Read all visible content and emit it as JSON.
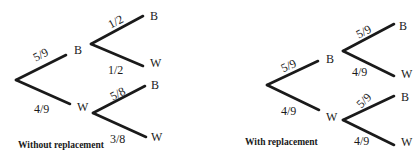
{
  "diagrams": [
    {
      "caption": "Without replacement",
      "root": {
        "x": 16,
        "y": 80
      },
      "level1": [
        {
          "outcome": "B",
          "prob": "5/9",
          "end": [
            66,
            55
          ],
          "label_pos": [
            74,
            54
          ],
          "prob_pos": [
            33,
            59
          ],
          "prob_rot": -28
        },
        {
          "outcome": "W",
          "prob": "4/9",
          "end": [
            70,
            104
          ],
          "label_pos": [
            77,
            111
          ],
          "prob_pos": [
            34,
            113
          ],
          "prob_rot": 0
        }
      ],
      "level2": [
        {
          "parent": "B",
          "start": [
            91,
            44
          ],
          "branches": [
            {
              "outcome": "B",
              "prob": "1/2",
              "end": [
                143,
                16
              ],
              "label_pos": [
                150,
                20
              ],
              "prob_pos": [
                108,
                26
              ],
              "prob_rot": -28
            },
            {
              "outcome": "W",
              "prob": "1/2",
              "end": [
                143,
                66
              ],
              "label_pos": [
                150,
                67
              ],
              "prob_pos": [
                108,
                74
              ],
              "prob_rot": 0
            }
          ]
        },
        {
          "parent": "W",
          "start": [
            93,
            113
          ],
          "branches": [
            {
              "outcome": "B",
              "prob": "5/8",
              "end": [
                145,
                86
              ],
              "label_pos": [
                151,
                89
              ],
              "prob_pos": [
                110,
                98
              ],
              "prob_rot": -28
            },
            {
              "outcome": "W",
              "prob": "3/8",
              "end": [
                146,
                137
              ],
              "label_pos": [
                151,
                141
              ],
              "prob_pos": [
                110,
                143
              ],
              "prob_rot": 0
            }
          ]
        }
      ],
      "caption_pos": [
        18,
        148
      ]
    },
    {
      "caption": "With replacement",
      "root": {
        "x": 267,
        "y": 85
      },
      "level1": [
        {
          "outcome": "B",
          "prob": "5/9",
          "end": [
            318,
            61
          ],
          "label_pos": [
            326,
            63
          ],
          "prob_pos": [
            281,
            70
          ],
          "prob_rot": -25
        },
        {
          "outcome": "W",
          "prob": "4/9",
          "end": [
            319,
            110
          ],
          "label_pos": [
            326,
            121
          ],
          "prob_pos": [
            281,
            115
          ],
          "prob_rot": 0
        }
      ],
      "level2": [
        {
          "parent": "B",
          "start": [
            343,
            51
          ],
          "branches": [
            {
              "outcome": "B",
              "prob": "5/9",
              "end": [
                394,
                24
              ],
              "label_pos": [
                399,
                30
              ],
              "prob_pos": [
                356,
                36
              ],
              "prob_rot": -28
            },
            {
              "outcome": "W",
              "prob": "4/9",
              "end": [
                394,
                76
              ],
              "label_pos": [
                401,
                78
              ],
              "prob_pos": [
                352,
                76
              ],
              "prob_rot": 0
            }
          ]
        },
        {
          "parent": "W",
          "start": [
            343,
            120
          ],
          "branches": [
            {
              "outcome": "B",
              "prob": "5/9",
              "end": [
                394,
                96
              ],
              "label_pos": [
                401,
                101
              ],
              "prob_pos": [
                356,
                106
              ],
              "prob_rot": -45
            },
            {
              "outcome": "W",
              "prob": "4/9",
              "end": [
                394,
                145
              ],
              "label_pos": [
                401,
                146
              ],
              "prob_pos": [
                354,
                145
              ],
              "prob_rot": 0
            }
          ]
        }
      ],
      "caption_pos": [
        245,
        145
      ]
    }
  ]
}
